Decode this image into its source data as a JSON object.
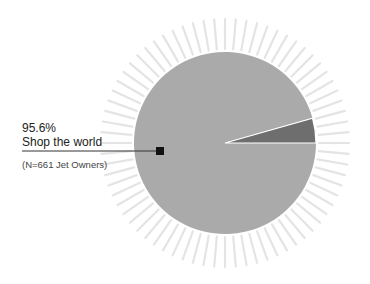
{
  "chart_data": {
    "type": "pie",
    "title": "",
    "categories": [
      "Shop the world",
      "Other"
    ],
    "values": [
      95.6,
      4.4
    ],
    "colors": [
      "#aaaaaa",
      "#6e6e6e"
    ],
    "labeled_slice": {
      "percent_label": "95.6%",
      "name": "Shop the world",
      "note": "(N=661 Jet Owners)"
    },
    "sample": "N=661 Jet Owners",
    "legend": "none",
    "grid": false,
    "decoration": "sunburst rays around pie"
  },
  "geometry": {
    "cx": 225,
    "cy": 143,
    "r": 91,
    "ray_inner": 94,
    "ray_outer": 124,
    "ray_count": 72
  }
}
